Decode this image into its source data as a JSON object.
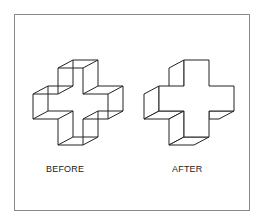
{
  "figure": {
    "labels": {
      "before": "BEFORE",
      "after": "AFTER"
    },
    "stroke_color": "#222222",
    "frame_color": "#8a8a8a",
    "shapes": [
      {
        "name": "before-cross",
        "description": "3D cross outline, ambiguous/recessed (Necker-like) interpretation"
      },
      {
        "name": "after-cross",
        "description": "3D cross outline, solid extruded interpretation"
      }
    ]
  }
}
